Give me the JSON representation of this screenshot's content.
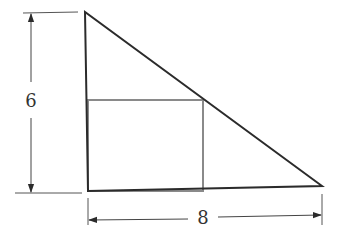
{
  "diagram": {
    "triangle": {
      "vertices": [
        [
          85,
          12
        ],
        [
          88,
          191
        ],
        [
          322,
          186
        ]
      ],
      "stroke": "#2b2b2b"
    },
    "rectangle": {
      "x": 88,
      "y": 100,
      "width": 115,
      "height": 91,
      "stroke": "#8a8a8a"
    },
    "dimensions": {
      "height_label": "6",
      "width_label": "8"
    }
  }
}
